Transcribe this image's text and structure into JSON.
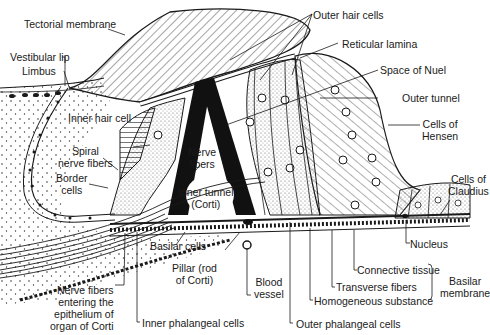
{
  "colors": {
    "ink": "#1a1a1a",
    "background": "#ffffff",
    "stipple": "#555555"
  },
  "labels": {
    "tectorial_membrane": "Tectorial membrane",
    "outer_hair_cells": "Outer hair cells",
    "reticular_lamina": "Reticular lamina",
    "vestibular_lip": "Vestibular lip",
    "limbus": "Limbus",
    "space_of_nuel": "Space of Nuel",
    "outer_tunnel": "Outer tunnel",
    "inner_hair_cell": "Inner hair cell",
    "cells_of_hensen": "Cells of\nHensen",
    "spiral_nerve_fibers": "Spiral\nnerve fibers",
    "nerve_fibers": "Nerve\nfibers",
    "border_cells": "Border\ncells",
    "cells_of_claudius": "Cells of\nClaudius",
    "inner_tunnel": "Inner tunnel\n(Corti)",
    "nucleus": "Nucleus",
    "basilar_cells": "Basilar cells",
    "pillar": "Pillar (rod\nof Corti)",
    "blood_vessel": "Blood\nvessel",
    "connective_tissue": "Connective tissue",
    "basilar_membrane": "Basilar\nmembrane",
    "transverse_fibers": "Transverse fibers",
    "homogeneous_substance": "Homogeneous substance",
    "nerve_fibers_entering": "Nerve fibers\nentering the\nepithelium of\norgan of Corti",
    "inner_phalangeal_cells": "Inner phalangeal cells",
    "outer_phalangeal_cells": "Outer phalangeal cells"
  }
}
